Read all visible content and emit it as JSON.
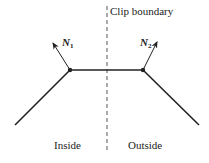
{
  "diagram": {
    "boundary_label": "Clip boundary",
    "inside_label": "Inside",
    "outside_label": "Outside",
    "normal_1": {
      "symbol": "N",
      "subscript": "1"
    },
    "normal_2": {
      "symbol": "N",
      "subscript": "2"
    },
    "colors": {
      "line": "#222222",
      "background": "#ffffff"
    }
  }
}
